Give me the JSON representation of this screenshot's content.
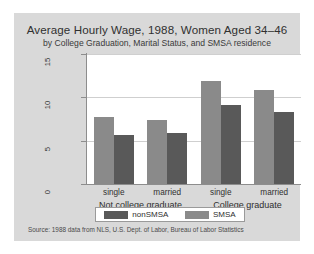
{
  "chart_data": {
    "type": "bar",
    "title": "Average Hourly Wage, 1988, Women Aged 34–46",
    "subtitle": "by College Graduation, Marital Status, and SMSA residence",
    "xlabel": "",
    "ylabel": "",
    "ylim": [
      0,
      15
    ],
    "yticks": [
      "0",
      "5",
      "10",
      "15"
    ],
    "grid": true,
    "legend_position": "bottom",
    "categories": [
      "single",
      "married",
      "single",
      "married"
    ],
    "groups": [
      {
        "label": "Not college graduate",
        "categories": [
          "single",
          "married"
        ]
      },
      {
        "label": "College graduate",
        "categories": [
          "single",
          "married"
        ]
      }
    ],
    "series": [
      {
        "name": "nonSMSA",
        "color": "#8a8a8a",
        "values": [
          7.7,
          7.4,
          11.9,
          10.9
        ]
      },
      {
        "name": "SMSA",
        "color": "#595959",
        "values": [
          5.6,
          5.9,
          9.1,
          8.3
        ]
      }
    ],
    "source": "Source:  1988 data from NLS, U.S. Dept. of Labor, Bureau of Labor Statistics"
  },
  "legend": {
    "entries": [
      {
        "label": "nonSMSA"
      },
      {
        "label": "SMSA"
      }
    ]
  }
}
